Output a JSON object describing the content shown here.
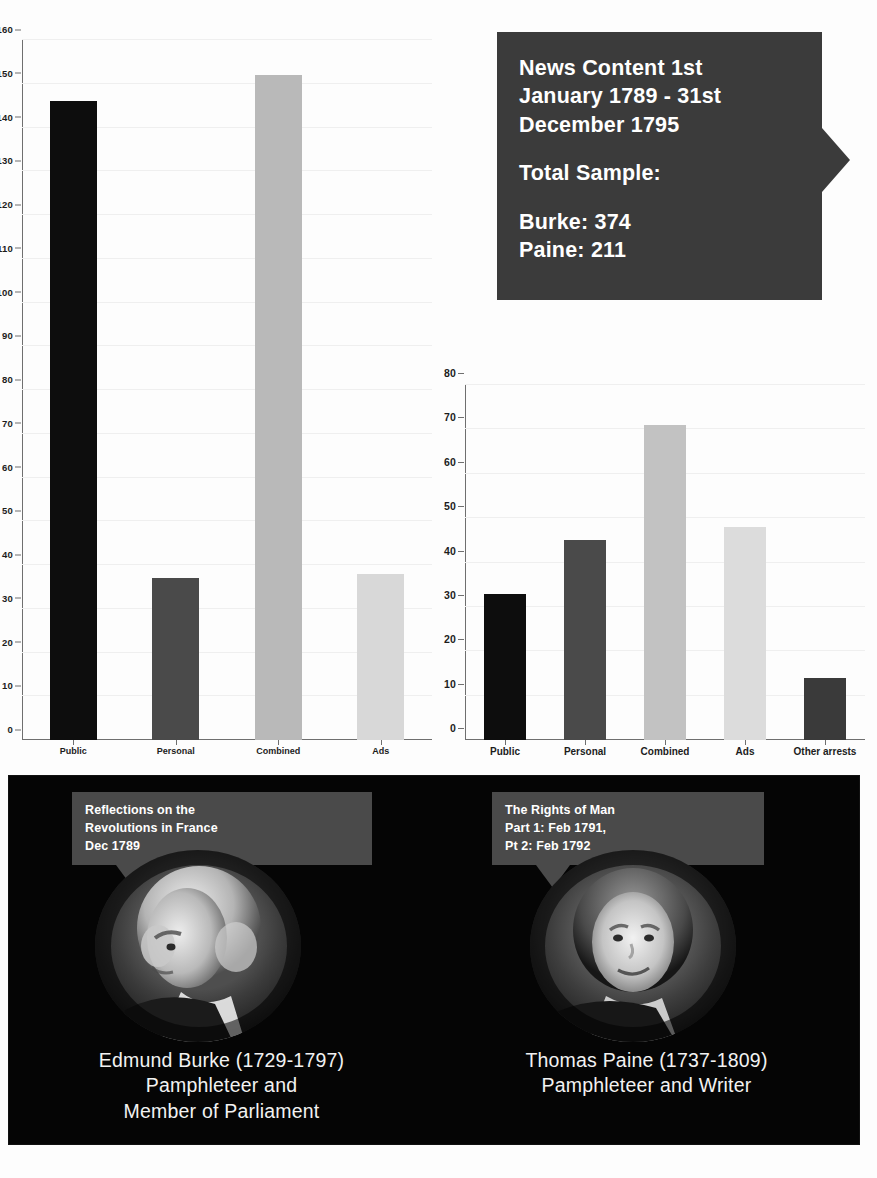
{
  "news_callout": {
    "heading": "News Content 1st January 1789 - 31st December 1795",
    "line1": "News Content 1st",
    "line2": "January 1789 - 31st",
    "line3": "December 1795",
    "total_label": "Total Sample:",
    "burke_total": "Burke: 374",
    "paine_total": "Paine: 211",
    "bg_color": "#3b3b3b",
    "text_color": "#ffffff"
  },
  "chart_data": [
    {
      "id": "burke-chart",
      "type": "bar",
      "title": "",
      "xlabel": "",
      "ylabel": "",
      "categories": [
        "Public",
        "Personal",
        "Combined",
        "Ads"
      ],
      "values": [
        146,
        37,
        152,
        38
      ],
      "colors": [
        "#0d0d0d",
        "#4a4a4a",
        "#b9b9b9",
        "#d8d8d8"
      ],
      "ylim": [
        0,
        160
      ],
      "yticks": [
        0,
        10,
        20,
        30,
        40,
        50,
        60,
        70,
        80,
        90,
        100,
        110,
        120,
        130,
        140,
        150,
        160
      ],
      "grid": true,
      "legend": "none"
    },
    {
      "id": "paine-chart",
      "type": "bar",
      "title": "",
      "xlabel": "",
      "ylabel": "",
      "categories": [
        "Public",
        "Personal",
        "Combined",
        "Ads",
        "Other arrests"
      ],
      "values": [
        33,
        45,
        71,
        48,
        14
      ],
      "colors": [
        "#0d0d0d",
        "#4a4a4a",
        "#c2c2c2",
        "#dcdcdc",
        "#3a3a3a"
      ],
      "ylim": [
        0,
        80
      ],
      "yticks": [
        0,
        10,
        20,
        30,
        40,
        50,
        60,
        70,
        80
      ],
      "grid": true,
      "legend": "none"
    }
  ],
  "people": [
    {
      "id": "burke",
      "work_callout": "Reflections on the\nRevolutions in France\nDec 1789",
      "caption": "Edmund Burke (1729-1797)\nPamphleteer and\nMember of Parliament",
      "portrait_alt": "portrait-edmund-burke"
    },
    {
      "id": "paine",
      "work_callout": "The Rights of Man\nPart 1: Feb 1791,\nPt 2: Feb 1792",
      "caption": "Thomas Paine (1737-1809)\nPamphleteer and Writer",
      "portrait_alt": "portrait-thomas-paine"
    }
  ],
  "panel": {
    "bg_color": "#050505",
    "callout_bg": "#4a4a4a",
    "caption_color": "#f2f2f2"
  }
}
